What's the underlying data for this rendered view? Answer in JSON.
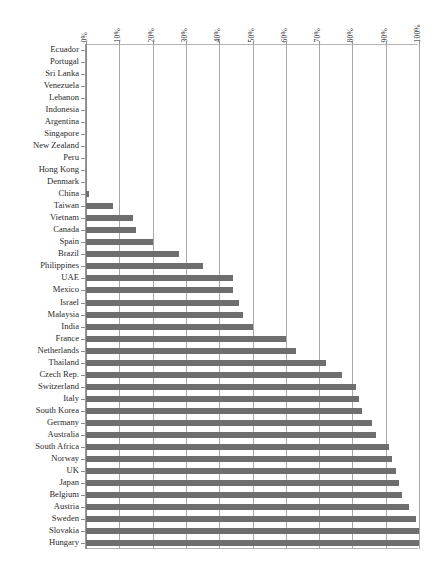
{
  "chart_data": {
    "type": "bar",
    "orientation": "horizontal",
    "title": "",
    "subtitle": "",
    "xlabel": "",
    "ylabel": "",
    "xlim": [
      0,
      100
    ],
    "grid": true,
    "legend": null,
    "axis": {
      "x_tick_labels": [
        "0%",
        "10%",
        "20%",
        "30%",
        "40%",
        "50%",
        "60%",
        "70%",
        "80%",
        "90%",
        "100%"
      ],
      "x_tick_values": [
        0,
        10,
        20,
        30,
        40,
        50,
        60,
        70,
        80,
        90,
        100
      ],
      "x_tick_rotation": 90
    },
    "categories": [
      "Ecuador",
      "Portugal",
      "Sri Lanka",
      "Venezuela",
      "Lebanon",
      "Indonesia",
      "Argentina",
      "Singapore",
      "New Zealand",
      "Peru",
      "Hong Kong",
      "Denmark",
      "China",
      "Taiwan",
      "Vietnam",
      "Canada",
      "Spain",
      "Brazil",
      "Philippines",
      "UAE",
      "Mexico",
      "Israel",
      "Malaysia",
      "India",
      "France",
      "Netherlands",
      "Thailand",
      "Czech Rep.",
      "Switzerland",
      "Italy",
      "South Korea",
      "Germany",
      "Australia",
      "South Africa",
      "Norway",
      "UK",
      "Japan",
      "Belgium",
      "Austria",
      "Sweden",
      "Slovakia",
      "Hungary"
    ],
    "values": [
      0,
      0,
      0,
      0,
      0,
      0,
      0,
      0,
      0,
      0,
      0,
      0,
      1,
      8,
      14,
      15,
      20,
      28,
      35,
      44,
      44,
      46,
      47,
      50,
      60,
      63,
      72,
      77,
      81,
      82,
      83,
      86,
      87,
      91,
      92,
      93,
      94,
      95,
      97,
      99,
      100,
      100
    ],
    "colors": {
      "bar": "#6e6e6e",
      "gridline": "#a8a8a8",
      "axis": "#8a8a8a",
      "text": "#2b2b2b",
      "background": "#ffffff"
    }
  }
}
